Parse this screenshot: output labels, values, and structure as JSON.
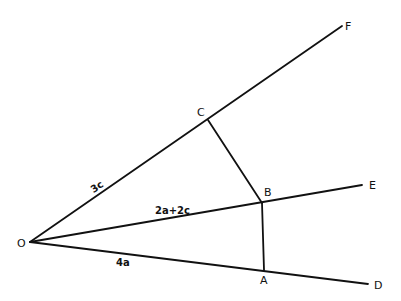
{
  "diagram": {
    "type": "vector geometry",
    "points": {
      "O": {
        "label": "O",
        "x": 30,
        "y": 242
      },
      "A": {
        "label": "A",
        "x": 264,
        "y": 270
      },
      "B": {
        "label": "B",
        "x": 262,
        "y": 203
      },
      "C": {
        "label": "C",
        "x": 208,
        "y": 120
      },
      "D": {
        "label": "D",
        "x": 368,
        "y": 284
      },
      "E": {
        "label": "E",
        "x": 362,
        "y": 185
      },
      "F": {
        "label": "F",
        "x": 342,
        "y": 26
      }
    },
    "vectors": {
      "OC": "3c",
      "OB": "2a+2c",
      "OA": "4a"
    },
    "segments": [
      [
        "O",
        "F"
      ],
      [
        "O",
        "E"
      ],
      [
        "O",
        "D"
      ],
      [
        "C",
        "B"
      ],
      [
        "B",
        "A"
      ]
    ]
  }
}
